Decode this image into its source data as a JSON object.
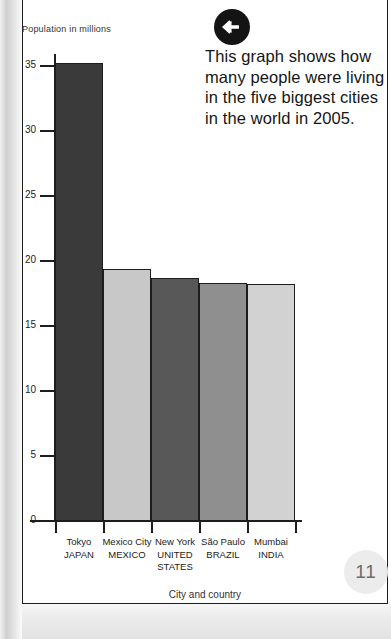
{
  "page": {
    "number": "11",
    "caption": "This graph shows how many people were living in the five biggest cities in the world in 2005.",
    "back_arrow_icon": "arrow-left-circle-icon"
  },
  "chart_data": {
    "type": "bar",
    "title": "",
    "xlabel": "City and country",
    "ylabel": "Population in millions",
    "categories": [
      "Tokyo",
      "Mexico City",
      "New York",
      "São Paulo",
      "Mumbai"
    ],
    "countries": [
      "JAPAN",
      "MEXICO",
      "UNITED STATES",
      "BRAZIL",
      "INDIA"
    ],
    "values": [
      35.2,
      19.4,
      18.7,
      18.3,
      18.2
    ],
    "ylim": [
      0,
      36.5
    ],
    "yticks": [
      "0",
      "5",
      "10",
      "15",
      "20",
      "25",
      "30",
      "35"
    ],
    "ytick_values": [
      0,
      5,
      10,
      15,
      20,
      25,
      30,
      35
    ],
    "grid": false,
    "legend": "none",
    "bar_colors": [
      "#3a3a3a",
      "#c8c8c8",
      "#585858",
      "#8f8f8f",
      "#d2d2d2"
    ],
    "bar_border_color": "#1d1d1d",
    "axis_color": "#1d1d1d"
  }
}
